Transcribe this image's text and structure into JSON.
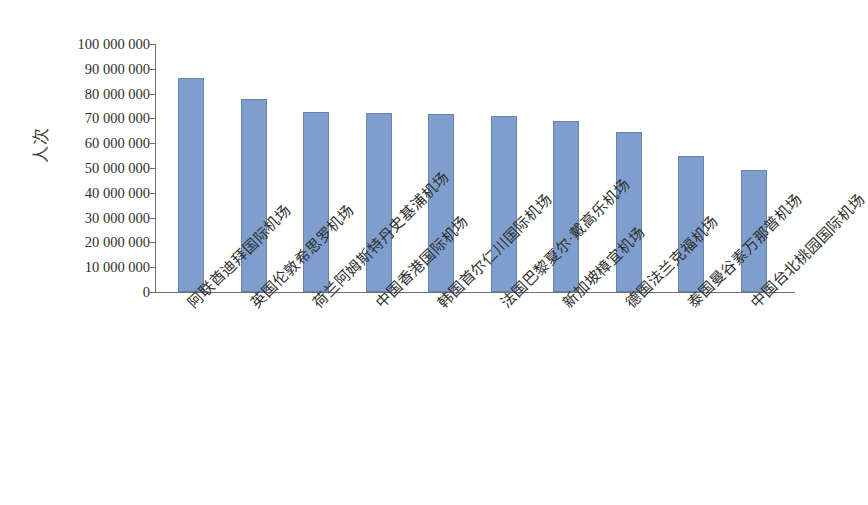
{
  "chart_data": {
    "type": "bar",
    "title": "",
    "subtitle": "",
    "xlabel": "",
    "ylabel": "人次",
    "ylim": [
      0,
      100000000
    ],
    "ytick_step": 10000000,
    "grid": false,
    "legend": "none",
    "bar_color": "#7e9fcd",
    "bar_border_color": "#6b83a8",
    "axis_color": "#6e6e6e",
    "background": "#ffffff",
    "categories": [
      "阿联酋迪拜国际机场",
      "英国伦敦希思罗机场",
      "荷兰阿姆斯特丹史基浦机场",
      "中国香港国际机场",
      "韩国首尔仁川国际机场",
      "法国巴黎夏尔·戴高乐机场",
      "新加坡樟宜机场",
      "德国法兰克福机场",
      "泰国曼谷素万那普机场",
      "中国台北桃园国际机场"
    ],
    "values": [
      86400000,
      77800000,
      72400000,
      72200000,
      71700000,
      71000000,
      68800000,
      64500000,
      54800000,
      49300000
    ],
    "ytick_labels": [
      "100 000 000",
      "90 000 000",
      "80 000 000",
      "70 000 000",
      "60 000 000",
      "50 000 000",
      "40 000 000",
      "30 000 000",
      "20 000 000",
      "10 000 000",
      "0"
    ],
    "ytick_values": [
      100000000,
      90000000,
      80000000,
      70000000,
      60000000,
      50000000,
      40000000,
      30000000,
      20000000,
      10000000,
      0
    ]
  }
}
